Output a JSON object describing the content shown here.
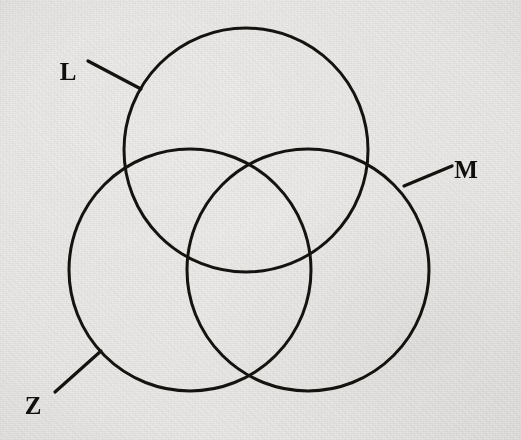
{
  "figure": {
    "kind": "venn-diagram",
    "set_count": 3,
    "background_color": "#efeeec",
    "ink_color": "#15130f",
    "stroke_width": 3,
    "canvas": {
      "width": 521,
      "height": 440
    }
  },
  "sets": [
    {
      "id": "L",
      "label": "L",
      "position": "top",
      "circle": {
        "cx": 246,
        "cy": 150,
        "r": 122
      },
      "label_pos": {
        "x": 68,
        "y": 80
      },
      "leader": {
        "x1": 88,
        "y1": 61,
        "x2": 141,
        "y2": 89
      }
    },
    {
      "id": "M",
      "label": "M",
      "position": "right",
      "circle": {
        "cx": 308,
        "cy": 270,
        "r": 121
      },
      "label_pos": {
        "x": 466,
        "y": 178
      },
      "leader": {
        "x1": 452,
        "y1": 166,
        "x2": 404,
        "y2": 186
      }
    },
    {
      "id": "Z",
      "label": "Z",
      "position": "left",
      "circle": {
        "cx": 190,
        "cy": 270,
        "r": 121
      },
      "label_pos": {
        "x": 33,
        "y": 414
      },
      "leader": {
        "x1": 55,
        "y1": 392,
        "x2": 101,
        "y2": 351
      }
    }
  ],
  "label_font_size": 25
}
